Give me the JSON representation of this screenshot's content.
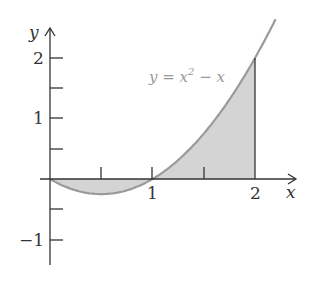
{
  "chart_data": {
    "type": "area",
    "title": "",
    "function": "y = x^2 - x",
    "annotation": "y = x² − x",
    "xlabel": "x",
    "ylabel": "y",
    "xlim": [
      0,
      2.3
    ],
    "ylim": [
      -1.4,
      2.5
    ],
    "x_ticks": [
      0.5,
      1,
      1.5,
      2
    ],
    "x_tick_labels": [
      "1",
      "2"
    ],
    "y_ticks": [
      -1,
      -0.5,
      0.5,
      1,
      1.5,
      2
    ],
    "y_tick_labels": [
      "−1",
      "1",
      "2"
    ],
    "shaded_region": {
      "from": 0,
      "to": 2
    },
    "curve_range": [
      0,
      2.2
    ],
    "colors": {
      "curve": "#9a9a9a",
      "fill": "#d4d4d4",
      "axes": "#333333"
    }
  },
  "labels": {
    "x_axis": "x",
    "y_axis": "y",
    "x1": "1",
    "x2": "2",
    "y1": "1",
    "y2": "2",
    "ym1": "−1",
    "eq_main": "y = x",
    "eq_sup": "2",
    "eq_tail": " − x"
  }
}
